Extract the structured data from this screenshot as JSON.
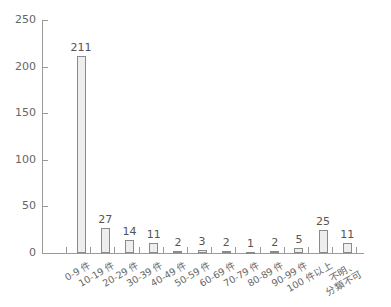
{
  "chart_data": {
    "type": "bar",
    "title": "",
    "xlabel": "",
    "ylabel": "",
    "ylim": [
      0,
      250
    ],
    "yticks": [
      0,
      50,
      100,
      150,
      200,
      250
    ],
    "grid": false,
    "legend": null,
    "categories": [
      "0-9 件",
      "10-19 件",
      "20-29 件",
      "30-39 件",
      "40-49 件",
      "50-59 件",
      "60-69 件",
      "70-79 件",
      "80-89 件",
      "90-99 件",
      "100 件以上",
      "不明、分類不可"
    ],
    "category_lines": [
      [
        "0-9 件"
      ],
      [
        "10-19 件"
      ],
      [
        "20-29 件"
      ],
      [
        "30-39 件"
      ],
      [
        "40-49 件"
      ],
      [
        "50-59 件"
      ],
      [
        "60-69 件"
      ],
      [
        "70-79 件"
      ],
      [
        "80-89 件"
      ],
      [
        "90-99 件"
      ],
      [
        "100 件以上"
      ],
      [
        "不明、",
        "分類不可"
      ]
    ],
    "values": [
      211,
      27,
      14,
      11,
      2,
      3,
      2,
      1,
      2,
      5,
      25,
      11
    ],
    "value_labels": [
      "211",
      "27",
      "14",
      "11",
      "2",
      "3",
      "2",
      "1",
      "2",
      "5",
      "25",
      "11"
    ],
    "colors": {
      "bar_fill": "#eeeeee",
      "bar_border": "#8a8a8a",
      "axis": "#9a9a9a"
    }
  }
}
